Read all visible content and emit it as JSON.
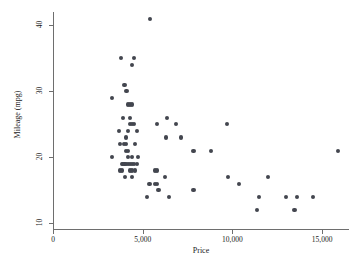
{
  "figure": {
    "background": "#ffffff",
    "marker_color": "#43464f",
    "axis_color": "#6e6e6e"
  },
  "chart_data": {
    "type": "scatter",
    "title": "",
    "xlabel": "Price",
    "ylabel": "Mileage (mpg)",
    "xlim": [
      0,
      16500
    ],
    "ylim": [
      9,
      42
    ],
    "xticks": [
      0,
      5000,
      10000,
      15000
    ],
    "xticklabels": [
      "0",
      "5,000",
      "10,000",
      "15,000"
    ],
    "yticks": [
      10,
      20,
      30,
      40
    ],
    "yticklabels": [
      "10",
      "20",
      "30",
      "40"
    ],
    "grid": false,
    "legend": null,
    "marker": "circle",
    "series": [
      {
        "name": "Mileage vs Price",
        "points": [
          [
            5397,
            41
          ],
          [
            3799,
            35
          ],
          [
            4504,
            35
          ],
          [
            4425,
            34
          ],
          [
            3984,
            31
          ],
          [
            3299,
            29
          ],
          [
            4099,
            30
          ],
          [
            4187,
            28
          ],
          [
            4296,
            28
          ],
          [
            4389,
            28
          ],
          [
            3895,
            26
          ],
          [
            4290,
            26
          ],
          [
            4296,
            25
          ],
          [
            4389,
            25
          ],
          [
            4499,
            25
          ],
          [
            6342,
            26
          ],
          [
            5799,
            25
          ],
          [
            6850,
            25
          ],
          [
            9690,
            25
          ],
          [
            3667,
            24
          ],
          [
            4195,
            24
          ],
          [
            4697,
            24
          ],
          [
            4060,
            23
          ],
          [
            6303,
            23
          ],
          [
            7140,
            23
          ],
          [
            3748,
            22
          ],
          [
            3955,
            22
          ],
          [
            4082,
            22
          ],
          [
            4589,
            22
          ],
          [
            4082,
            21
          ],
          [
            4187,
            21
          ],
          [
            7827,
            21
          ],
          [
            8814,
            21
          ],
          [
            15906,
            21
          ],
          [
            3291,
            20
          ],
          [
            4195,
            20
          ],
          [
            4424,
            20
          ],
          [
            4723,
            20
          ],
          [
            3829,
            19
          ],
          [
            3895,
            19
          ],
          [
            3984,
            19
          ],
          [
            4060,
            19
          ],
          [
            4172,
            19
          ],
          [
            4296,
            19
          ],
          [
            4389,
            19
          ],
          [
            4499,
            19
          ],
          [
            4697,
            19
          ],
          [
            3748,
            18
          ],
          [
            3829,
            18
          ],
          [
            4296,
            18
          ],
          [
            4424,
            18
          ],
          [
            4589,
            18
          ],
          [
            5705,
            18
          ],
          [
            5799,
            18
          ],
          [
            4010,
            17
          ],
          [
            4425,
            17
          ],
          [
            6229,
            17
          ],
          [
            9735,
            17
          ],
          [
            11995,
            17
          ],
          [
            5379,
            16
          ],
          [
            5705,
            16
          ],
          [
            5788,
            16
          ],
          [
            10372,
            16
          ],
          [
            5886,
            15
          ],
          [
            7827,
            15
          ],
          [
            5222,
            14
          ],
          [
            6486,
            14
          ],
          [
            11497,
            14
          ],
          [
            12990,
            14
          ],
          [
            13594,
            14
          ],
          [
            14500,
            14
          ],
          [
            11385,
            12
          ],
          [
            13466,
            12
          ]
        ]
      }
    ]
  }
}
